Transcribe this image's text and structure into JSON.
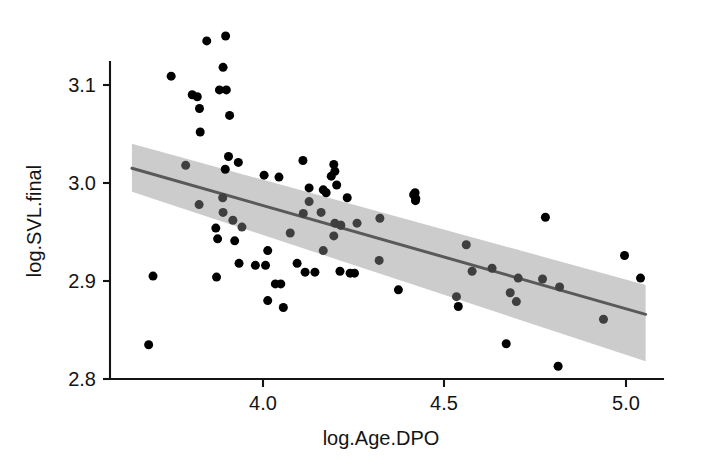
{
  "chart_data": {
    "type": "scatter",
    "title": "",
    "subtitle": "",
    "xlabel": "log.Age.DPO",
    "ylabel": "log.SVL.final",
    "xlim": [
      3.62,
      5.03
    ],
    "ylim": [
      2.795,
      3.155
    ],
    "xticks": [
      4.0,
      4.5,
      5.0
    ],
    "xticklabels": [
      "4.0",
      "4.5",
      "5.0"
    ],
    "yticks": [
      2.8,
      2.9,
      3.0,
      3.1
    ],
    "yticklabels": [
      "2.8",
      "2.9",
      "3.0",
      "3.1"
    ],
    "grid": false,
    "legend": null,
    "legend_position": "none",
    "point_color": "#000000",
    "line_color": "#595959",
    "band_color": "#c9c9c9",
    "axis_color": "#141414",
    "marker": "filled-circle",
    "marker_size_px": 9,
    "n_points": 83,
    "series": [
      {
        "name": "observations",
        "type": "scatter",
        "points": [
          [
            3.845,
            3.145
          ],
          [
            3.897,
            3.15
          ],
          [
            3.89,
            3.118
          ],
          [
            3.747,
            3.109
          ],
          [
            3.805,
            3.09
          ],
          [
            3.819,
            3.088
          ],
          [
            3.899,
            3.095
          ],
          [
            3.88,
            3.095
          ],
          [
            3.825,
            3.076
          ],
          [
            3.908,
            3.069
          ],
          [
            3.827,
            3.052
          ],
          [
            3.905,
            3.027
          ],
          [
            3.932,
            3.021
          ],
          [
            3.896,
            3.014
          ],
          [
            3.787,
            3.018
          ],
          [
            4.003,
            3.008
          ],
          [
            4.11,
            3.023
          ],
          [
            4.188,
            3.007
          ],
          [
            4.195,
            3.019
          ],
          [
            4.198,
            3.012
          ],
          [
            4.203,
            2.998
          ],
          [
            4.415,
            2.988
          ],
          [
            4.42,
            2.982
          ],
          [
            3.824,
            2.978
          ],
          [
            3.89,
            2.97
          ],
          [
            3.917,
            2.962
          ],
          [
            3.87,
            2.954
          ],
          [
            3.942,
            2.955
          ],
          [
            3.875,
            2.943
          ],
          [
            3.922,
            2.941
          ],
          [
            4.013,
            2.931
          ],
          [
            3.934,
            2.918
          ],
          [
            3.979,
            2.916
          ],
          [
            4.007,
            2.916
          ],
          [
            3.872,
            2.904
          ],
          [
            4.049,
            2.897
          ],
          [
            4.034,
            2.897
          ],
          [
            4.013,
            2.88
          ],
          [
            4.056,
            2.873
          ],
          [
            3.697,
            2.905
          ],
          [
            3.685,
            2.835
          ],
          [
            4.127,
            2.995
          ],
          [
            4.166,
            2.993
          ],
          [
            4.174,
            2.99
          ],
          [
            4.127,
            2.981
          ],
          [
            4.111,
            2.969
          ],
          [
            4.16,
            2.97
          ],
          [
            4.198,
            2.959
          ],
          [
            4.214,
            2.957
          ],
          [
            4.259,
            2.959
          ],
          [
            4.322,
            2.964
          ],
          [
            4.075,
            2.949
          ],
          [
            4.166,
            2.931
          ],
          [
            4.32,
            2.921
          ],
          [
            4.094,
            2.918
          ],
          [
            4.116,
            2.909
          ],
          [
            4.143,
            2.909
          ],
          [
            4.212,
            2.91
          ],
          [
            4.24,
            2.908
          ],
          [
            4.252,
            2.908
          ],
          [
            4.373,
            2.891
          ],
          [
            4.533,
            2.884
          ],
          [
            4.419,
            2.99
          ],
          [
            4.421,
            2.984
          ],
          [
            4.778,
            2.965
          ],
          [
            4.56,
            2.937
          ],
          [
            4.996,
            2.926
          ],
          [
            4.576,
            2.91
          ],
          [
            4.631,
            2.913
          ],
          [
            4.703,
            2.903
          ],
          [
            4.77,
            2.902
          ],
          [
            5.04,
            2.903
          ],
          [
            4.681,
            2.888
          ],
          [
            4.817,
            2.894
          ],
          [
            4.698,
            2.879
          ],
          [
            4.538,
            2.874
          ],
          [
            4.938,
            2.861
          ],
          [
            4.67,
            2.836
          ],
          [
            4.813,
            2.813
          ],
          [
            4.195,
            2.946
          ],
          [
            4.214,
            2.957
          ],
          [
            3.889,
            2.985
          ],
          [
            4.044,
            3.006
          ],
          [
            4.232,
            2.985
          ]
        ]
      },
      {
        "name": "linear-fit",
        "type": "line",
        "points": [
          [
            3.639,
            3.015
          ],
          [
            5.054,
            2.866
          ]
        ]
      },
      {
        "name": "confidence-band",
        "type": "band",
        "x": [
          3.639,
          5.054
        ],
        "upper": [
          3.04,
          2.896
        ],
        "lower": [
          2.991,
          2.818
        ]
      }
    ],
    "annotations": []
  },
  "axes": {
    "x_axis_name": "log.Age.DPO",
    "y_axis_name": "log.SVL.final"
  }
}
